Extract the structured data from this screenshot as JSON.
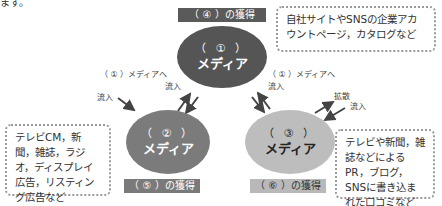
{
  "top_cutoff_text": "ます。",
  "center": {
    "acquire_label": "（ ④ ）の獲得",
    "ellipse_number": "（ ① ）",
    "ellipse_title": "メディア",
    "note": "自社サイトやSNSの企業アカウントページ，カタログなど"
  },
  "left": {
    "acquire_label": "（ ⑤ ）の獲得",
    "ellipse_number": "（ ② ）",
    "ellipse_title": "メディア",
    "note": "テレビCM，新聞，雑誌，ラジオ，ディスプレイ広告，リスティング広告など",
    "to_center_label_line1": "（ ① ）メディアへ",
    "to_center_label_line2": "流入",
    "inflow_label": "流入"
  },
  "right": {
    "acquire_label": "（ ⑥ ）の獲得",
    "ellipse_number": "（ ③ ）",
    "ellipse_title": "メディア",
    "note": "テレビや新聞，雑誌などによるPR，ブログ，SNSに書き込まれた口コミなど",
    "to_center_label_line1": "（ ① ）メディアへ",
    "to_center_label_line2": "流入",
    "spread_label": "拡散",
    "inflow_label": "流入"
  },
  "colors": {
    "media1": "#555555",
    "media2": "#7b7b7b",
    "media3": "#bdbdbd",
    "arrow": "#444444",
    "note_border": "#9a9a9a"
  }
}
